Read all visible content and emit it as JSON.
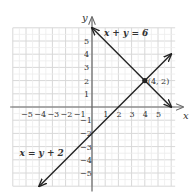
{
  "chart_data": {
    "type": "line",
    "title": "",
    "xlabel": "x",
    "ylabel": "y",
    "xlim": [
      -6,
      6.5
    ],
    "ylim": [
      -6,
      6.5
    ],
    "grid": true,
    "x_ticks": [
      -5,
      -4,
      -3,
      -2,
      -1,
      1,
      2,
      3,
      4,
      5
    ],
    "y_ticks": [
      -5,
      -4,
      -3,
      -2,
      -1,
      1,
      2,
      3,
      4,
      5
    ],
    "series": [
      {
        "name": "x + y = 6",
        "equation": "x + y = 6",
        "points": [
          [
            0,
            6
          ],
          [
            6,
            0
          ]
        ],
        "arrows": "both",
        "color": "#222222"
      },
      {
        "name": "x = y + 2",
        "equation": "x = y + 2",
        "points": [
          [
            -4,
            -6
          ],
          [
            6,
            4
          ]
        ],
        "arrows": "both",
        "color": "#222222"
      }
    ],
    "annotations": [
      {
        "type": "point",
        "x": 4,
        "y": 2,
        "label": "(4, 2)"
      }
    ],
    "labels": {
      "line1": "x + y = 6",
      "line2": "x = y + 2",
      "intersection": "(4, 2)"
    }
  }
}
